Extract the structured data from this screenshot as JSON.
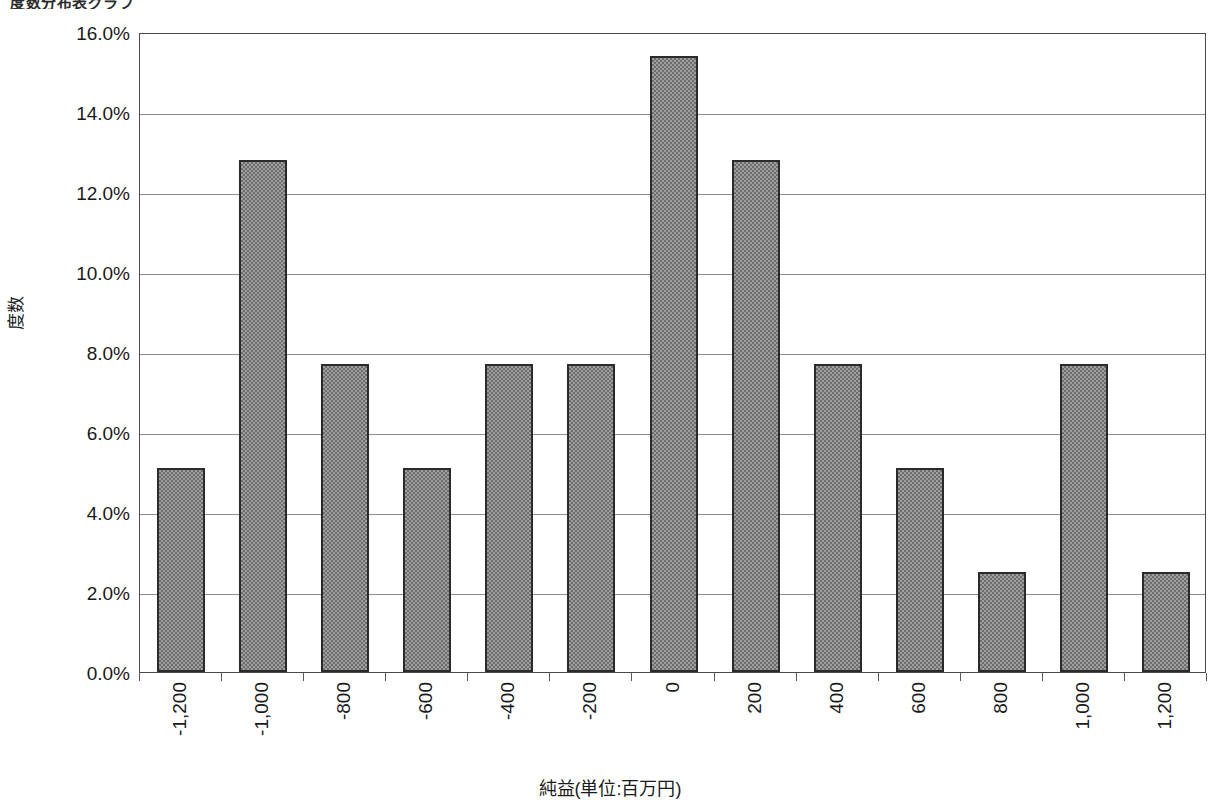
{
  "clipped_top_title": "度数分布表グラフ",
  "chart_data": {
    "type": "bar",
    "title": "",
    "xlabel": "純益(単位:百万円)",
    "ylabel": "度数",
    "categories": [
      "-1,200",
      "-1,000",
      "-800",
      "-600",
      "-400",
      "-200",
      "0",
      "200",
      "400",
      "600",
      "800",
      "1,000",
      "1,200"
    ],
    "values": [
      5.1,
      12.8,
      7.7,
      5.1,
      7.7,
      7.7,
      15.4,
      12.8,
      7.7,
      5.1,
      2.5,
      7.7,
      2.5
    ],
    "value_labels": [
      "5.1%",
      "12.8%",
      "7.7%",
      "5.1%",
      "7.7%",
      "7.7%",
      "15.4%",
      "12.8%",
      "7.7%",
      "5.1%",
      "2.5%",
      "7.7%",
      "2.5%"
    ],
    "ylim": [
      0.0,
      16.0
    ],
    "ytick_values": [
      0.0,
      2.0,
      4.0,
      6.0,
      8.0,
      10.0,
      12.0,
      14.0,
      16.0
    ],
    "ytick_labels": [
      "0.0%",
      "2.0%",
      "4.0%",
      "6.0%",
      "8.0%",
      "10.0%",
      "12.0%",
      "14.0%",
      "16.0%"
    ],
    "grid": true,
    "legend": false,
    "legend_position": "none",
    "bar_fill_color": "#9e9e9e",
    "bar_pattern": "50% checkerboard dither",
    "bar_border_color": "#2a2a2a",
    "gridline_color": "#8d8d8d",
    "axis_color": "#4a4a4a",
    "background_color": "#ffffff"
  }
}
